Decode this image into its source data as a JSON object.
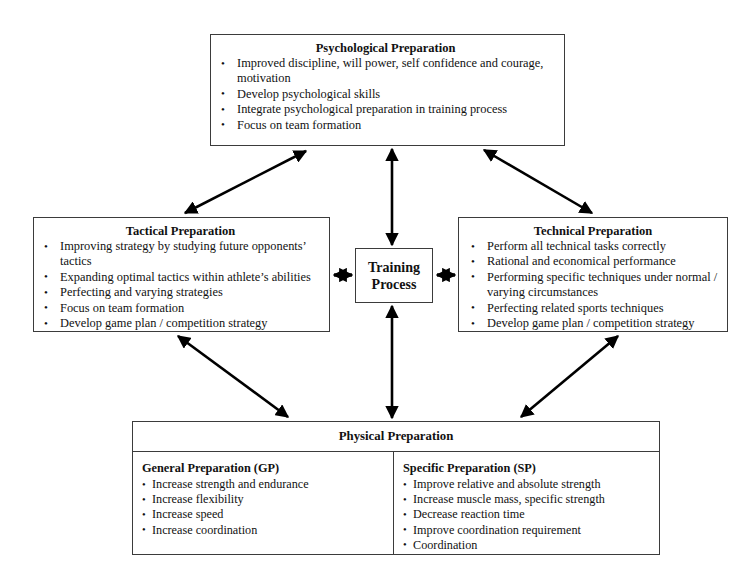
{
  "diagram": {
    "center": {
      "label_line1": "Training",
      "label_line2": "Process"
    },
    "boxes": {
      "psychological": {
        "title": "Psychological Preparation",
        "bullets": [
          "Improved discipline, will power, self confidence and courage, motivation",
          "Develop psychological skills",
          "Integrate psychological preparation in training process",
          "Focus on team formation"
        ]
      },
      "tactical": {
        "title": "Tactical Preparation",
        "bullets": [
          "Improving strategy by studying future opponents’ tactics",
          "Expanding optimal tactics within athlete’s abilities",
          "Perfecting and varying strategies",
          "Focus on team formation",
          "Develop game plan / competition strategy"
        ]
      },
      "technical": {
        "title": "Technical Preparation",
        "bullets": [
          "Perform all technical tasks correctly",
          "Rational and economical performance",
          "Performing specific techniques under normal / varying circumstances",
          "Perfecting related sports techniques",
          "Develop game plan / competition strategy"
        ]
      },
      "physical": {
        "title": "Physical Preparation",
        "general": {
          "subtitle": "General Preparation (GP)",
          "bullets": [
            "Increase strength and endurance",
            "Increase flexibility",
            "Increase speed",
            "Increase coordination"
          ]
        },
        "specific": {
          "subtitle": "Specific Preparation (SP)",
          "bullets": [
            "Improve relative and  absolute strength",
            "Increase muscle mass, specific strength",
            "Decrease reaction time",
            "Improve coordination requirement",
            "Coordination"
          ]
        }
      }
    },
    "connectors": [
      {
        "name": "tactical-to-psychological",
        "style": "double-headed diagonal"
      },
      {
        "name": "technical-to-psychological",
        "style": "double-headed diagonal"
      },
      {
        "name": "tactical-to-physical",
        "style": "double-headed diagonal"
      },
      {
        "name": "technical-to-physical",
        "style": "double-headed diagonal"
      },
      {
        "name": "training-to-psychological",
        "style": "double-headed vertical"
      },
      {
        "name": "training-to-physical",
        "style": "double-headed vertical"
      },
      {
        "name": "training-to-tactical",
        "style": "double-headed horizontal"
      },
      {
        "name": "training-to-technical",
        "style": "double-headed horizontal"
      }
    ],
    "colors": {
      "line": "#3b3b3b",
      "arrow": "#000000",
      "background": "#ffffff",
      "text": "#111111"
    }
  }
}
